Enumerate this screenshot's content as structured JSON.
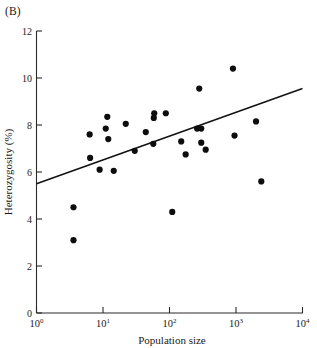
{
  "figure": {
    "panel_label": "(B)"
  },
  "chart_data": {
    "type": "scatter",
    "title": "",
    "xlabel": "Population size",
    "ylabel": "Heterozygosity (%)",
    "xscale": "log",
    "yscale": "linear",
    "xlim": [
      1,
      10000
    ],
    "ylim": [
      0,
      12
    ],
    "grid": false,
    "legend": null,
    "x_tick_labels": [
      "10⁰",
      "10¹",
      "10²",
      "10³",
      "10⁴"
    ],
    "x_tick_bases": [
      "10",
      "10",
      "10",
      "10",
      "10"
    ],
    "x_tick_exponents": [
      "0",
      "1",
      "2",
      "3",
      "4"
    ],
    "x_tick_values": [
      1,
      10,
      100,
      1000,
      10000
    ],
    "y_tick_labels": [
      "0",
      "2",
      "4",
      "6",
      "8",
      "10",
      "12"
    ],
    "y_tick_values": [
      0,
      2,
      4,
      6,
      8,
      10,
      12
    ],
    "points": [
      {
        "x": 3.6,
        "y": 4.5
      },
      {
        "x": 3.6,
        "y": 3.1
      },
      {
        "x": 6.3,
        "y": 7.6
      },
      {
        "x": 6.4,
        "y": 6.6
      },
      {
        "x": 8.9,
        "y": 6.1
      },
      {
        "x": 11.0,
        "y": 7.85
      },
      {
        "x": 11.6,
        "y": 8.35
      },
      {
        "x": 12.0,
        "y": 7.4
      },
      {
        "x": 14.5,
        "y": 6.05
      },
      {
        "x": 22.0,
        "y": 8.05
      },
      {
        "x": 30.0,
        "y": 6.9
      },
      {
        "x": 44.0,
        "y": 7.7
      },
      {
        "x": 57.0,
        "y": 7.2
      },
      {
        "x": 58.0,
        "y": 8.3
      },
      {
        "x": 59.0,
        "y": 8.5
      },
      {
        "x": 88.0,
        "y": 8.5
      },
      {
        "x": 110.0,
        "y": 4.3
      },
      {
        "x": 150.0,
        "y": 7.3
      },
      {
        "x": 175.0,
        "y": 6.75
      },
      {
        "x": 260.0,
        "y": 7.85
      },
      {
        "x": 280.0,
        "y": 9.55
      },
      {
        "x": 300.0,
        "y": 7.85
      },
      {
        "x": 300.0,
        "y": 7.25
      },
      {
        "x": 350.0,
        "y": 6.95
      },
      {
        "x": 900.0,
        "y": 10.4
      },
      {
        "x": 950.0,
        "y": 7.55
      },
      {
        "x": 2000.0,
        "y": 8.15
      },
      {
        "x": 2400.0,
        "y": 5.6
      }
    ],
    "fit_line": {
      "type": "linear-on-log-x",
      "x_start": 1,
      "y_start": 5.5,
      "x_end": 10000,
      "y_end": 9.55
    }
  }
}
